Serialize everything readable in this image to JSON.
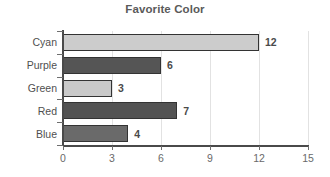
{
  "chart_data": {
    "type": "bar",
    "orientation": "horizontal",
    "title": "Favorite Color",
    "xlabel": "",
    "ylabel": "",
    "categories": [
      "Cyan",
      "Purple",
      "Green",
      "Red",
      "Blue"
    ],
    "values": [
      12,
      6,
      3,
      7,
      4
    ],
    "bar_colors": [
      "#cccccc",
      "#555555",
      "#c9c9c9",
      "#535353",
      "#6a6a6a"
    ],
    "bar_border_color": "#333333",
    "value_labels": [
      "12",
      "6",
      "3",
      "7",
      "4"
    ],
    "xlim": [
      0,
      15
    ],
    "xticks": [
      0,
      3,
      6,
      9,
      12,
      15
    ],
    "xtick_labels": [
      "0",
      "3",
      "6",
      "9",
      "12",
      "15"
    ],
    "grid": true,
    "grid_color": "#e2e2e2",
    "axis_color": "#4a4a4a",
    "legend": null,
    "background": "#ffffff",
    "title_color": "#5a5a5a",
    "label_color": "#4f4f4f"
  }
}
